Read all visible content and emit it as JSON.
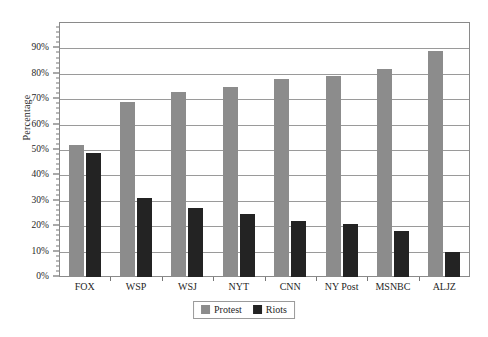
{
  "chart_data": {
    "type": "bar",
    "title": "",
    "subtitle": "",
    "xlabel": "",
    "ylabel": "Percentage",
    "categories": [
      "FOX",
      "WSP",
      "WSJ",
      "NYT",
      "CNN",
      "NY Post",
      "MSNBC",
      "ALJZ"
    ],
    "series": [
      {
        "name": "Protest",
        "color": "#8c8c8c",
        "values": [
          52,
          69,
          73,
          75,
          78,
          79,
          82,
          89
        ]
      },
      {
        "name": "Riots",
        "color": "#232323",
        "values": [
          49,
          31,
          27,
          25,
          22,
          21,
          18,
          10
        ]
      }
    ],
    "ylim": [
      0,
      100
    ],
    "y_ticks": [
      0,
      10,
      20,
      30,
      40,
      50,
      60,
      70,
      80,
      90
    ],
    "y_tick_labels": [
      "0%",
      "10%",
      "20%",
      "30%",
      "40%",
      "50%",
      "60%",
      "70%",
      "80%",
      "90%"
    ],
    "grid": true,
    "grid_axis": "y",
    "legend_position": "bottom-center",
    "legend_entries": [
      "Protest",
      "Riots"
    ],
    "frame": true
  }
}
